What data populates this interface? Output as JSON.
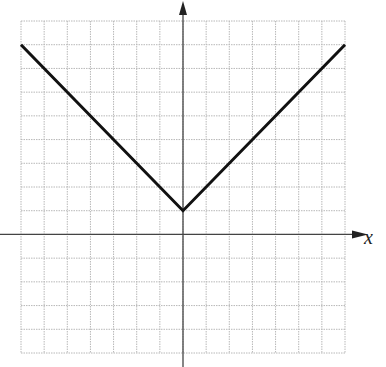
{
  "chart_data": {
    "type": "line",
    "title": "",
    "xlabel": "x",
    "ylabel": "",
    "function": "y = |x| + 1",
    "series": [
      {
        "name": "f(x)",
        "x": [
          -7,
          0,
          7
        ],
        "y": [
          8,
          1,
          8
        ]
      }
    ],
    "xlim": [
      -7,
      7
    ],
    "ylim": [
      -5,
      9
    ],
    "grid": true,
    "legend": "none",
    "colors": {
      "line": "#111111",
      "grid": "#b8b8b8",
      "axis": "#444444"
    }
  }
}
